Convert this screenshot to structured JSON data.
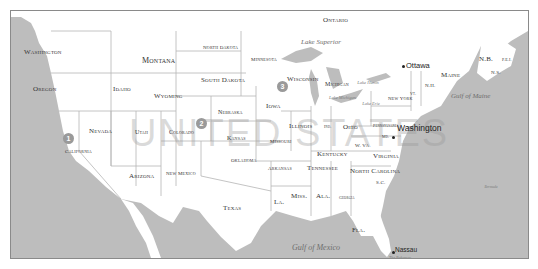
{
  "map": {
    "title": "United States",
    "watermark": "UNITED STATES",
    "colors": {
      "land": "#ffffff",
      "water": "#bdbdbd",
      "border": "#8a8a8a",
      "state_line": "#b5b5b5",
      "marker": "#9a9a9a"
    },
    "countries": {
      "canada_region": "Ontario"
    },
    "states": {
      "washington": "Washington",
      "oregon": "Oregon",
      "california": "California",
      "nevada": "Nevada",
      "idaho": "Idaho",
      "montana": "Montana",
      "wyoming": "Wyoming",
      "utah": "Utah",
      "colorado": "Colorado",
      "arizona": "Arizona",
      "new_mexico": "New Mexico",
      "north_dakota": "North Dakota",
      "south_dakota": "South Dakota",
      "nebraska": "Nebraska",
      "kansas": "Kansas",
      "oklahoma": "Oklahoma",
      "texas": "Texas",
      "minnesota": "Minnesota",
      "iowa": "Iowa",
      "missouri": "Missouri",
      "arkansas": "Arkansas",
      "louisiana": "La.",
      "wisconsin": "Wisconsin",
      "illinois": "Illinois",
      "michigan": "Michigan",
      "indiana": "Ind.",
      "ohio": "Ohio",
      "kentucky": "Kentucky",
      "tennessee": "Tennessee",
      "mississippi": "Miss.",
      "alabama": "Ala.",
      "georgia": "Georgia",
      "florida": "Fla.",
      "south_carolina": "S.C.",
      "north_carolina": "North Carolina",
      "virginia": "Virginia",
      "west_virginia": "W. Va.",
      "maryland": "Md.",
      "pennsylvania": "Pennsylvania",
      "new_jersey": "N.J.",
      "new_york": "New York",
      "vermont": "Vt.",
      "new_hampshire": "N.H.",
      "maine": "Maine",
      "new_brunswick": "N.B.",
      "nova_scotia": "N.S.",
      "pei": "P.E.I."
    },
    "water_bodies": {
      "lake_superior": "Lake Superior",
      "lake_michigan": "Lake Michigan",
      "lake_huron": "Lake Huron",
      "lake_erie": "Lake Erie",
      "gulf_of_maine": "Gulf of Maine",
      "gulf_of_mexico": "Gulf of Mexico",
      "atlantic": "Bermuda",
      "bahamas": "The Bahamas"
    },
    "cities": {
      "ottawa": "Ottawa",
      "washington_dc": "Washington",
      "nassau": "Nassau"
    },
    "markers": [
      {
        "label": "1"
      },
      {
        "label": "2"
      },
      {
        "label": "3"
      }
    ]
  }
}
